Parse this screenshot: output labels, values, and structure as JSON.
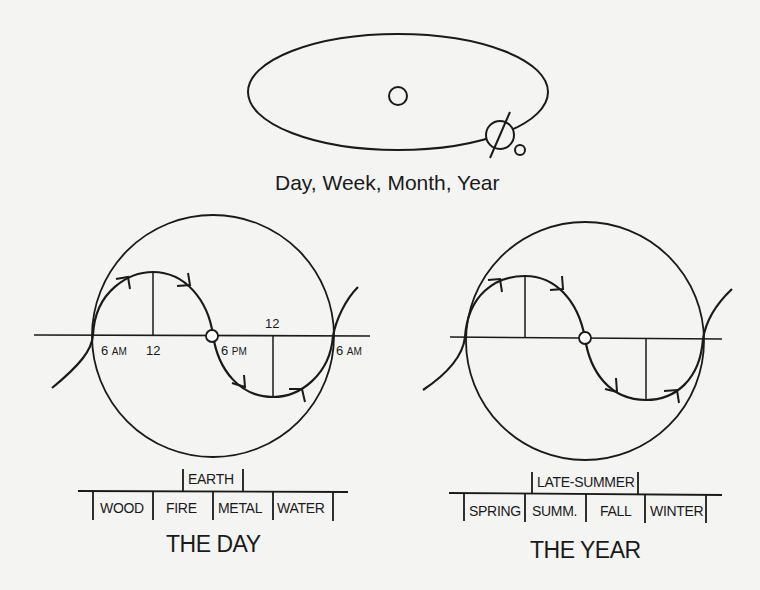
{
  "orbit": {
    "caption": "Day, Week, Month, Year",
    "sun": "sun-circle",
    "earth": "earth-with-axis",
    "moon": "moon-circle"
  },
  "day": {
    "title": "THE DAY",
    "ticks": [
      {
        "num": "6",
        "suffix": "AM"
      },
      {
        "num": "12",
        "suffix": ""
      },
      {
        "num": "6",
        "suffix": "PM"
      },
      {
        "num": "12",
        "suffix": ""
      },
      {
        "num": "6",
        "suffix": "AM"
      }
    ],
    "center_phase": "EARTH",
    "phases": [
      "WOOD",
      "FIRE",
      "METAL",
      "WATER"
    ]
  },
  "year": {
    "title": "THE YEAR",
    "center_phase": "LATE-SUMMER",
    "phases": [
      "SPRING",
      "SUMM.",
      "FALL",
      "WINTER"
    ]
  },
  "colors": {
    "background": "#f4f4f3",
    "ink": "#1a1a1a"
  }
}
